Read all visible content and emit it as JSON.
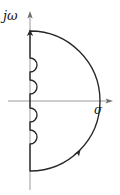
{
  "figure": {
    "name": "nyquist-d-contour",
    "width": 120,
    "height": 195,
    "background_color": "#ffffff"
  },
  "axes": {
    "vertical": {
      "label": "jω",
      "icon": "imaginary-axis-arrow",
      "color": "#9a9a9a",
      "x": 30,
      "top_y": 12,
      "bottom_y": 190,
      "arrow_at": "top"
    },
    "horizontal": {
      "label": "σ",
      "icon": "real-axis-arrow",
      "color": "#9a9a9a",
      "y": 101,
      "left_x": 8,
      "right_x": 112,
      "arrow_at": "right"
    },
    "origin": {
      "x": 30,
      "y": 101
    }
  },
  "contour": {
    "color": "#262626",
    "stroke_width": 1.3,
    "big_arc": {
      "center_x": 30,
      "center_y": 101,
      "radius": 70,
      "top_y": 31,
      "bottom_y": 171,
      "rightmost_x": 100
    },
    "indentations": [
      {
        "name": "semicircle-upper-1",
        "center_y": 57,
        "radius": 7,
        "bulge": "right"
      },
      {
        "name": "semicircle-upper-2",
        "center_y": 79,
        "radius": 7,
        "bulge": "right"
      },
      {
        "name": "semicircle-lower-1",
        "center_y": 115,
        "radius": 7,
        "bulge": "right"
      },
      {
        "name": "semicircle-lower-2",
        "center_y": 137,
        "radius": 7,
        "bulge": "right"
      }
    ],
    "direction_markers": [
      {
        "name": "arrowhead-top",
        "x": 30,
        "y": 33,
        "angle": 0
      },
      {
        "name": "arrowhead-lower-arc",
        "x": 78,
        "y": 152,
        "angle": 128
      }
    ]
  }
}
